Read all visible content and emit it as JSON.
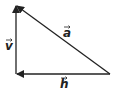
{
  "diagram": {
    "vectors": [
      {
        "name": "v",
        "label": "v",
        "from": [
          16,
          74
        ],
        "to": [
          16,
          5
        ]
      },
      {
        "name": "a",
        "label": "a",
        "from": [
          110,
          74
        ],
        "to": [
          16,
          5
        ]
      },
      {
        "name": "h",
        "label": "h",
        "from": [
          110,
          74
        ],
        "to": [
          16,
          74
        ]
      }
    ],
    "colors": {
      "line": "#222222",
      "background": "#ffffff"
    }
  }
}
